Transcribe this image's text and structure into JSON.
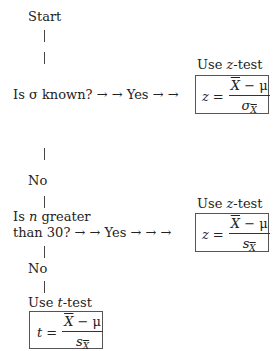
{
  "flowchart": {
    "start": "Start",
    "q1": {
      "text": "Is σ known?",
      "arrows1": "→ →",
      "yes": "Yes",
      "arrows2": "→ →"
    },
    "r1": {
      "label_pre": "Use ",
      "label_var": "z",
      "label_post": "-test",
      "lhs": "z",
      "eq": "=",
      "num_var": "X",
      "num_rest": " − μ",
      "den_var": "σ",
      "den_sub": "X"
    },
    "no1": "No",
    "q2": {
      "line1_pre": "Is ",
      "line1_var": "n",
      "line1_post": " greater",
      "line2": "than 30?",
      "arrows1": "→ →",
      "yes": "Yes",
      "arrows2": "→ → →"
    },
    "r2": {
      "label_pre": "Use ",
      "label_var": "z",
      "label_post": "-test",
      "lhs": "z",
      "eq": "=",
      "num_var": "X",
      "num_rest": " − μ",
      "den_var": "s",
      "den_sub": "X"
    },
    "no2": "No",
    "r3": {
      "label_pre": "Use ",
      "label_var": "t",
      "label_post": "-test",
      "lhs": "t",
      "eq": "=",
      "num_var": "X",
      "num_rest": " − μ",
      "den_var": "s",
      "den_sub": "X"
    }
  }
}
